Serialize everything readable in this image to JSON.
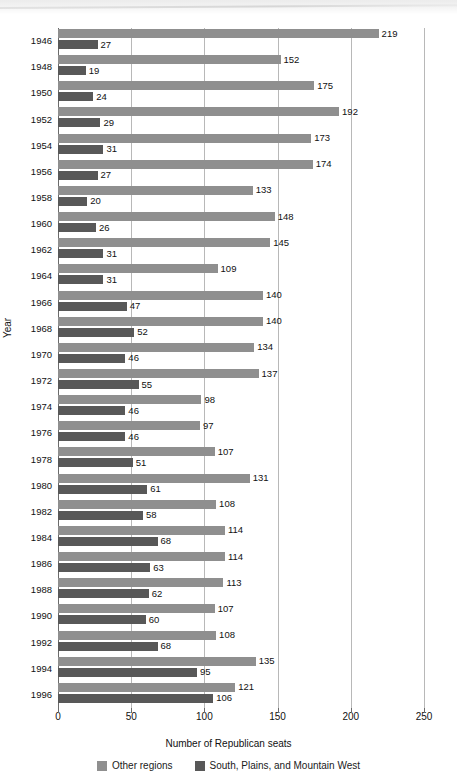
{
  "chart_data": {
    "type": "bar",
    "orientation": "horizontal",
    "title": "",
    "xlabel": "Number of Republican seats",
    "ylabel": "Year",
    "xlim": [
      0,
      250
    ],
    "xticks": [
      0,
      50,
      100,
      150,
      200,
      250
    ],
    "grid": true,
    "legend_position": "bottom",
    "categories": [
      "1946",
      "1948",
      "1950",
      "1952",
      "1954",
      "1956",
      "1958",
      "1960",
      "1962",
      "1964",
      "1966",
      "1968",
      "1970",
      "1972",
      "1974",
      "1976",
      "1978",
      "1980",
      "1982",
      "1984",
      "1986",
      "1988",
      "1990",
      "1992",
      "1994",
      "1996"
    ],
    "series": [
      {
        "name": "Other regions",
        "color": "#8f8f8f",
        "values": [
          219,
          152,
          175,
          192,
          173,
          174,
          133,
          148,
          145,
          109,
          140,
          140,
          134,
          137,
          98,
          97,
          107,
          131,
          108,
          114,
          114,
          113,
          107,
          108,
          135,
          121
        ]
      },
      {
        "name": "South, Plains, and Mountain West",
        "color": "#585858",
        "values": [
          27,
          19,
          24,
          29,
          31,
          27,
          20,
          26,
          31,
          31,
          47,
          52,
          46,
          55,
          46,
          46,
          51,
          61,
          58,
          68,
          63,
          62,
          60,
          68,
          95,
          106
        ]
      }
    ]
  },
  "legend": {
    "items": [
      {
        "label": "Other regions",
        "swatch": "other"
      },
      {
        "label": "South, Plains, and Mountain West",
        "swatch": "south"
      }
    ]
  }
}
